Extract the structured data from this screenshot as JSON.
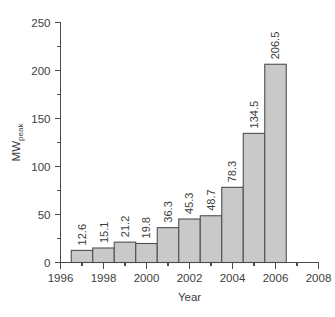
{
  "chart_data": {
    "type": "bar",
    "title": "",
    "xlabel": "Year",
    "ylabel": "MW",
    "ylabel_subscript": "peak",
    "categories": [
      1997,
      1998,
      1999,
      2000,
      2001,
      2002,
      2003,
      2004,
      2005,
      2006
    ],
    "values": [
      12.6,
      15.1,
      21.2,
      19.8,
      36.3,
      45.3,
      48.7,
      78.3,
      134.5,
      206.5
    ],
    "value_labels": [
      "12.6",
      "15.1",
      "21.2",
      "19.8",
      "36.3",
      "45.3",
      "48.7",
      "78.3",
      "134.5",
      "206.5"
    ],
    "bar_span": [
      [
        1996.5,
        1997.5
      ],
      [
        1997.5,
        1998.5
      ],
      [
        1998.5,
        1999.5
      ],
      [
        1999.5,
        2000.5
      ],
      [
        2000.5,
        2001.5
      ],
      [
        2001.5,
        2002.5
      ],
      [
        2002.5,
        2003.5
      ],
      [
        2003.5,
        2004.5
      ],
      [
        2004.5,
        2005.5
      ],
      [
        2005.5,
        2006.5
      ]
    ],
    "xlim": [
      1996,
      2008
    ],
    "ylim": [
      0,
      250
    ],
    "y_major_ticks": [
      0,
      50,
      100,
      150,
      200,
      250
    ],
    "y_major_tick_labels": [
      "0",
      "50",
      "100",
      "150",
      "200",
      "250"
    ],
    "y_minor_ticks": [
      25,
      75,
      125,
      175,
      225
    ],
    "x_major_ticks": [
      1996,
      1998,
      2000,
      2002,
      2004,
      2006,
      2008
    ],
    "x_major_tick_labels": [
      "1996",
      "1998",
      "2000",
      "2002",
      "2004",
      "2006",
      "2008"
    ],
    "x_minor_ticks": [
      1997,
      1999,
      2001,
      2003,
      2005,
      2007
    ],
    "grid": false,
    "legend": false,
    "value_label_rotation": -90,
    "bar_fill_color": "#c9c9c9",
    "bar_edge_color": "#4f4f4f",
    "axis_color": "#4a4a4a",
    "text_color": "#3d3d3d",
    "background_color": "#ffffff"
  }
}
